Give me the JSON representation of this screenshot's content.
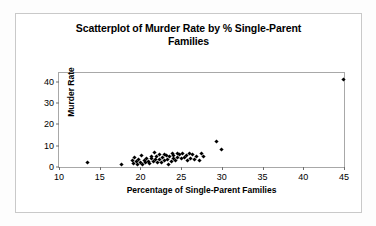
{
  "chart_data": {
    "type": "scatter",
    "title": "Scatterplot of Murder Rate by % Single-Parent Families",
    "title_line1": "Scatterplot of Murder Rate by % Single-Parent",
    "title_line2": "Families",
    "xlabel": "Percentage of Single-Parent Families",
    "ylabel": "Murder Rate",
    "xlim": [
      10,
      45
    ],
    "ylim": [
      0,
      44
    ],
    "xticks": [
      10,
      15,
      20,
      25,
      30,
      35,
      40,
      45
    ],
    "xtick_labels": [
      "10",
      "15",
      "20",
      "25",
      "30",
      "35",
      "40",
      "45"
    ],
    "yticks": [
      0,
      10,
      20,
      30,
      40
    ],
    "ytick_labels": [
      "0",
      "10",
      "20",
      "30",
      "40"
    ],
    "grid": false,
    "legend": null,
    "marker": "diamond",
    "marker_color": "#000000",
    "series": [
      {
        "name": "States",
        "points": [
          [
            13.5,
            2.0
          ],
          [
            17.7,
            1.2
          ],
          [
            19.0,
            3.1
          ],
          [
            19.1,
            1.6
          ],
          [
            19.3,
            4.4
          ],
          [
            19.5,
            2.6
          ],
          [
            19.6,
            1.1
          ],
          [
            19.8,
            3.5
          ],
          [
            20.0,
            2.2
          ],
          [
            20.1,
            5.3
          ],
          [
            20.3,
            1.4
          ],
          [
            20.5,
            3.0
          ],
          [
            20.6,
            2.0
          ],
          [
            20.8,
            4.1
          ],
          [
            21.0,
            2.7
          ],
          [
            21.1,
            1.5
          ],
          [
            21.3,
            3.8
          ],
          [
            21.4,
            5.0
          ],
          [
            21.6,
            2.4
          ],
          [
            21.7,
            6.6
          ],
          [
            21.9,
            3.3
          ],
          [
            22.0,
            4.7
          ],
          [
            22.1,
            2.0
          ],
          [
            22.3,
            5.8
          ],
          [
            22.4,
            3.6
          ],
          [
            22.6,
            1.9
          ],
          [
            22.7,
            4.3
          ],
          [
            22.9,
            6.0
          ],
          [
            23.0,
            2.9
          ],
          [
            23.2,
            5.2
          ],
          [
            23.3,
            3.4
          ],
          [
            23.5,
            1.1
          ],
          [
            23.6,
            4.9
          ],
          [
            23.8,
            2.5
          ],
          [
            23.9,
            6.3
          ],
          [
            24.0,
            4.0
          ],
          [
            24.1,
            5.6
          ],
          [
            24.3,
            3.2
          ],
          [
            24.5,
            6.5
          ],
          [
            24.6,
            4.6
          ],
          [
            24.8,
            5.9
          ],
          [
            25.0,
            3.9
          ],
          [
            25.2,
            6.1
          ],
          [
            25.4,
            4.4
          ],
          [
            25.6,
            5.4
          ],
          [
            25.8,
            2.9
          ],
          [
            26.0,
            6.4
          ],
          [
            26.2,
            4.2
          ],
          [
            26.4,
            5.7
          ],
          [
            26.6,
            3.7
          ],
          [
            26.9,
            5.0
          ],
          [
            27.2,
            3.1
          ],
          [
            27.5,
            6.2
          ],
          [
            27.8,
            4.8
          ],
          [
            29.3,
            12.0
          ],
          [
            30.0,
            8.3
          ],
          [
            44.9,
            41.0
          ]
        ]
      }
    ]
  }
}
